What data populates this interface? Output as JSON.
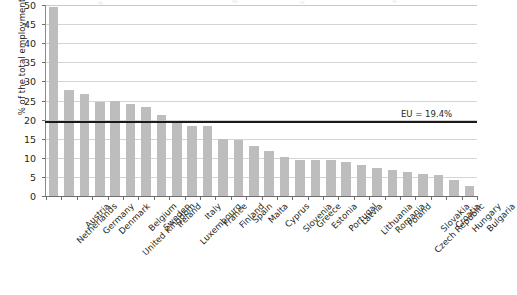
{
  "chart_data": {
    "type": "bar",
    "title": "",
    "subtitle": "",
    "xlabel": "",
    "ylabel": "% of the total employment",
    "ylim": [
      0,
      50
    ],
    "ytick_step": 5,
    "yticks": [
      0,
      5,
      10,
      15,
      20,
      25,
      30,
      35,
      40,
      45,
      50
    ],
    "ytick_labels": [
      "0",
      "5",
      "10",
      "15",
      "20",
      "25",
      "30",
      "35",
      "40",
      "45",
      "50"
    ],
    "grid": true,
    "grid_axis": "y",
    "legend": false,
    "legend_position": "none",
    "bar_color": "#bdbdbd",
    "categories": [
      "Netherlands",
      "Austria",
      "Germany",
      "Denmark",
      "United Kingdom",
      "Belgium",
      "Sweden",
      "Ireland",
      "Luxembourg",
      "Italy",
      "France",
      "Finland",
      "Spain",
      "Malta",
      "Cyprus",
      "Slovenia",
      "Greece",
      "Estonia",
      "Portugal",
      "Latvia",
      "Lithuania",
      "Romania",
      "Poland",
      "Czech Republic",
      "Slovakia",
      "Croatia",
      "Hungary",
      "Bulgaria"
    ],
    "values": [
      49.6,
      27.8,
      26.7,
      24.7,
      24.8,
      24.2,
      23.4,
      21.2,
      19.2,
      18.4,
      18.3,
      14.8,
      14.6,
      13.1,
      11.8,
      10.2,
      9.5,
      9.4,
      9.3,
      8.8,
      8.2,
      7.4,
      6.7,
      6.2,
      5.8,
      5.4,
      4.3,
      2.5
    ],
    "annotations": [
      {
        "name": "eu-average-line",
        "label": "EU = 19.4%",
        "value": 19.4,
        "orientation": "horizontal",
        "color": "#1a1a1a"
      }
    ]
  }
}
